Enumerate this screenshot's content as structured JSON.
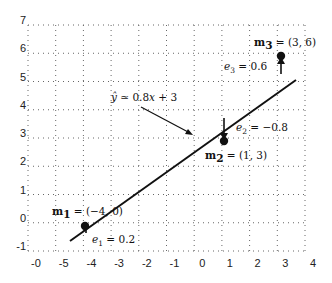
{
  "chart_data": {
    "type": "scatter",
    "title": "",
    "xlabel": "",
    "ylabel": "",
    "grid": true,
    "grid_style": "dotted",
    "xlim": [
      -6,
      4
    ],
    "ylim": [
      -1,
      7
    ],
    "x_tick_labels": [
      "-0",
      "-5",
      "-4",
      "-3",
      "-2",
      "-1",
      "0",
      "1",
      "2",
      "3",
      "4"
    ],
    "y_tick_labels": [
      "7",
      "6",
      "5",
      "4",
      "3",
      "2",
      "1",
      "0",
      "-1"
    ],
    "points": [
      {
        "name": "m1",
        "label": "m₁ = (−4, 0)",
        "x": -4,
        "y": 0,
        "residual_label": "e₁ = 0.2",
        "residual": 0.2
      },
      {
        "name": "m2",
        "label": "m₂ = (1, 3)",
        "x": 1,
        "y": 3,
        "residual_label": "e₂ = −0.8",
        "residual": -0.8
      },
      {
        "name": "m3",
        "label": "m₃ = (3, 6)",
        "x": 3,
        "y": 6,
        "residual_label": "e₃ = 0.6",
        "residual": 0.6
      }
    ],
    "regression_line": {
      "label": "ŷ ≃ 0.8x + 3",
      "slope": 0.8,
      "intercept": 3,
      "x_range": [
        -4.6,
        3.6
      ]
    },
    "annotations": [
      {
        "text": "ŷ ≃ 0.8x + 3",
        "points_to": "regression line",
        "arrow": true
      }
    ]
  },
  "labels": {
    "line_eq_yhat": "ŷ",
    "line_eq_rest": " ≃ 0.8",
    "line_eq_x": "x",
    "line_eq_tail": " + 3",
    "m1_name": "m",
    "m1_sub": "1",
    "m1_val": " = (−4, 0)",
    "m2_name": "m",
    "m2_sub": "2",
    "m2_val": " = (1, 3)",
    "m3_name": "m",
    "m3_sub": "3",
    "m3_val": " = (3, 6)",
    "e1_name": "e",
    "e1_sub": "1",
    "e1_val": " = 0.2",
    "e2_name": "e",
    "e2_sub": "2",
    "e2_val": " = −0.8",
    "e3_name": "e",
    "e3_sub": "3",
    "e3_val": " = 0.6"
  },
  "colors": {
    "line": "#111111",
    "grid": "#555555",
    "background": "#ffffff"
  }
}
